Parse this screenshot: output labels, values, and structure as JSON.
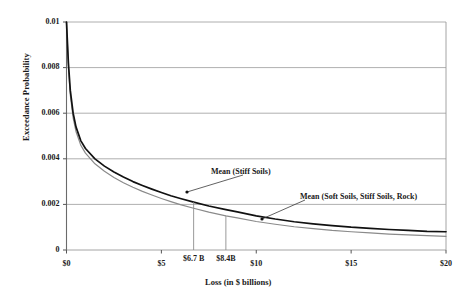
{
  "chart_data": {
    "type": "line",
    "title": "",
    "xlabel": "Loss (in $ billions)",
    "ylabel": "Exceedance Probability",
    "xlim": [
      0,
      20
    ],
    "ylim": [
      0,
      0.01
    ],
    "grid": true,
    "legend_position": "inline-annotations",
    "x_ticks": [
      {
        "value": 0,
        "label": "$0"
      },
      {
        "value": 5,
        "label": "$5"
      },
      {
        "value": 10,
        "label": "$10"
      },
      {
        "value": 15,
        "label": "$15"
      },
      {
        "value": 20,
        "label": "$20"
      }
    ],
    "y_ticks": [
      {
        "value": 0.01,
        "label": "0.01"
      },
      {
        "value": 0.008,
        "label": "0.008"
      },
      {
        "value": 0.006,
        "label": "0.006"
      },
      {
        "value": 0.004,
        "label": "0.004"
      },
      {
        "value": 0.002,
        "label": "0.002"
      },
      {
        "value": 0,
        "label": "0"
      }
    ],
    "series": [
      {
        "name": "Mean (Stiff Soils)",
        "color": "#111111",
        "x": [
          0,
          0.1,
          0.2,
          0.35,
          0.5,
          0.75,
          1.0,
          1.5,
          2.0,
          2.5,
          3.0,
          3.5,
          4.0,
          4.5,
          5.0,
          5.5,
          6.0,
          6.7,
          7.5,
          8.4,
          9.0,
          10.0,
          11.0,
          12.0,
          13.0,
          14.0,
          15.0,
          16.0,
          17.0,
          18.0,
          19.0,
          20.0
        ],
        "y": [
          0.01,
          0.0082,
          0.007,
          0.006,
          0.0054,
          0.0048,
          0.00445,
          0.004,
          0.00368,
          0.00342,
          0.0032,
          0.003,
          0.00283,
          0.00267,
          0.00252,
          0.00238,
          0.00226,
          0.0021,
          0.00193,
          0.00177,
          0.00167,
          0.0015,
          0.00136,
          0.00124,
          0.00115,
          0.00107,
          0.001,
          0.00095,
          0.0009,
          0.00086,
          0.00082,
          0.0008
        ]
      },
      {
        "name": "Mean (Soft Soils, Stiff Soils, Rock)",
        "color": "#8a8a8a",
        "x": [
          0,
          0.1,
          0.2,
          0.35,
          0.5,
          0.75,
          1.0,
          1.5,
          2.0,
          2.5,
          3.0,
          3.5,
          4.0,
          4.5,
          5.0,
          5.5,
          6.0,
          6.7,
          7.5,
          8.4,
          9.0,
          10.0,
          11.0,
          12.0,
          13.0,
          14.0,
          15.0,
          16.0,
          17.0,
          18.0,
          19.0,
          20.0
        ],
        "y": [
          0.01,
          0.008,
          0.0068,
          0.0058,
          0.0052,
          0.0046,
          0.00425,
          0.00378,
          0.00345,
          0.00318,
          0.00295,
          0.00275,
          0.00257,
          0.00241,
          0.00226,
          0.00212,
          0.00199,
          0.00183,
          0.00166,
          0.0015,
          0.00141,
          0.00125,
          0.00113,
          0.00102,
          0.00094,
          0.00086,
          0.0008,
          0.00075,
          0.0007,
          0.00066,
          0.00063,
          0.0006
        ]
      }
    ],
    "markers": [
      {
        "label": "$6.7 B",
        "x": 6.7,
        "series": "Mean (Stiff Soils)",
        "y": 0.0021
      },
      {
        "label": "$8.4B",
        "x": 8.4,
        "series": "Mean (Soft Soils, Stiff Soils, Rock)",
        "y": 0.0015
      }
    ],
    "annotations": [
      {
        "text": "Mean (Stiff Soils)",
        "text_x": 211,
        "text_y": 167,
        "leader_from_x": 243,
        "leader_from_y": 175,
        "leader_to_x": 187,
        "leader_to_y": 192
      },
      {
        "text": "Mean (Soft Soils, Stiff Soils, Rock)",
        "text_x": 300,
        "text_y": 192,
        "leader_from_x": 305,
        "leader_from_y": 200,
        "leader_to_x": 262,
        "leader_to_y": 219
      }
    ]
  }
}
